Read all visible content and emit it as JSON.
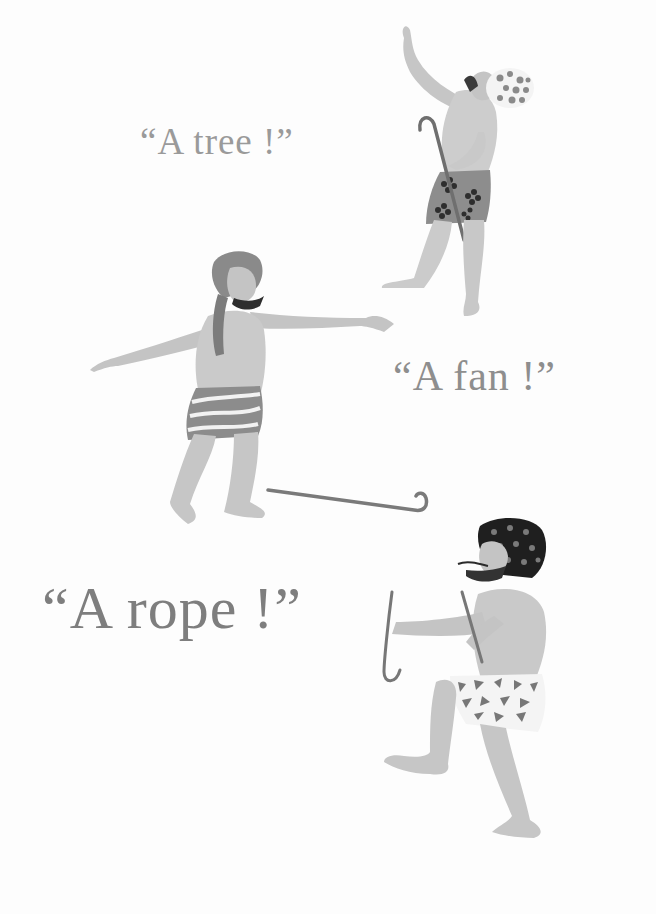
{
  "page": {
    "background": "#ffffff",
    "ink_color": "#8c8c8c"
  },
  "captions": {
    "tree": "“A tree !”",
    "fan": "“A fan !”",
    "rope": "“A rope !”"
  },
  "figures": [
    {
      "name": "man-reaching-up",
      "pose": "reaching up with cane, polka-dot turban, flower-pattern shorts"
    },
    {
      "name": "man-arms-outstretched",
      "pose": "arms spread wide, wrapped turban, striped shorts"
    },
    {
      "name": "man-holding-rope",
      "pose": "stepping forward holding cane, dark spotted turban, triangle-pattern shorts"
    }
  ],
  "objects": [
    {
      "name": "walking-cane-on-ground"
    }
  ]
}
